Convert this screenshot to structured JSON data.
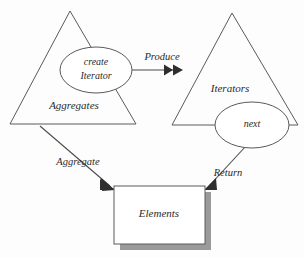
{
  "diagram": {
    "background_color": "#fdfdfd",
    "line_color": "#5a5a5a",
    "text_color": "#2b2b2b",
    "shadow_color": "#9a9a9a",
    "nodes": [
      {
        "id": "aggregates",
        "shape": "triangle",
        "label": "Aggregates",
        "apex": [
          70,
          11
        ],
        "bottom_left": [
          10,
          124
        ],
        "bottom_right": [
          136,
          124
        ],
        "label_position": [
          74,
          106
        ]
      },
      {
        "id": "iterators",
        "shape": "triangle",
        "label": "Iterators",
        "apex": [
          232,
          13
        ],
        "bottom_left": [
          172,
          125
        ],
        "bottom_right": [
          298,
          125
        ],
        "label_position": [
          230,
          89
        ]
      }
    ],
    "ellipses": [
      {
        "id": "create-iterator",
        "shape": "ellipse",
        "label_line1": "create",
        "label_line2": "Iterator",
        "center": [
          96,
          70
        ],
        "radius_x": 36,
        "radius_y": 23
      },
      {
        "id": "next",
        "shape": "ellipse",
        "label": "next",
        "center": [
          252,
          125
        ],
        "radius_x": 37,
        "radius_y": 23
      }
    ],
    "boxes": [
      {
        "id": "elements",
        "shape": "rectangle",
        "label": "Elements",
        "x": 114,
        "y": 186,
        "width": 91,
        "height": 58,
        "shadow_offset": 6,
        "label_position": [
          159,
          214
        ]
      }
    ],
    "edges": [
      {
        "id": "produce",
        "label": "Produce",
        "from": "create-iterator",
        "to": "iterators",
        "style": "double-arrow",
        "label_position": [
          162,
          60
        ],
        "path": "M132,70 L182,70"
      },
      {
        "id": "aggregate",
        "label": "Aggregate",
        "from": "aggregates",
        "to": "elements",
        "style": "arrow",
        "label_position": [
          78,
          163
        ],
        "path": "M40,126 L114,189"
      },
      {
        "id": "return",
        "label": "Return",
        "from": "next",
        "to": "elements",
        "style": "arrow",
        "label_position": [
          228,
          174
        ],
        "path": "M244,148 L205,189"
      }
    ]
  }
}
